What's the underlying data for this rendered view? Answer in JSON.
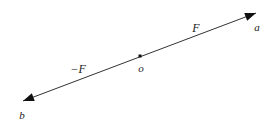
{
  "figure": {
    "background_color": "#ffffff",
    "stroke_color": "#333333",
    "text_color": "#1a1a1a",
    "line": {
      "start_x": 23,
      "start_y": 101,
      "end_x": 256,
      "end_y": 13,
      "stroke_width": 1
    },
    "arrowheads": [
      {
        "name": "arrowhead-a",
        "at": "end",
        "x": 256,
        "y": 13,
        "direction": "up-right"
      },
      {
        "name": "arrowhead-b",
        "at": "start",
        "x": 23,
        "y": 101,
        "direction": "down-left"
      }
    ],
    "origin_marker": {
      "x": 140,
      "y": 56,
      "size": 3,
      "shape": "square"
    },
    "labels": {
      "point_a": {
        "text": "a",
        "x": 257,
        "y": 27
      },
      "point_b": {
        "text": "b",
        "x": 22,
        "y": 115
      },
      "point_o": {
        "text": "o",
        "x": 141,
        "y": 68
      },
      "vector_positive": {
        "text": "F",
        "x": 196,
        "y": 28
      },
      "vector_negative": {
        "text": "−F",
        "x": 78,
        "y": 69
      }
    }
  }
}
